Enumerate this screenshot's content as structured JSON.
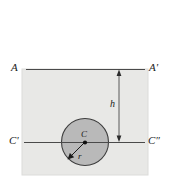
{
  "figure": {
    "background_color": "#ffffff",
    "plate": {
      "name": "rectangular-plate",
      "fill_color": "#e8e8e6",
      "stroke_color": "#d8d8d6",
      "x": 22,
      "y": 69,
      "width": 126,
      "height": 106
    },
    "circle": {
      "name": "circular-hole",
      "fill_color": "#b8b8b8",
      "stroke_color": "#404040",
      "cx": 85,
      "cy": 142,
      "r": 24
    },
    "center_dot": {
      "cx": 85,
      "cy": 142,
      "r": 2,
      "color": "#111111"
    },
    "lines": [
      {
        "name": "line-AA",
        "label_left": "A",
        "label_right": "A'",
        "y": 69,
        "x_start": 26,
        "x_end": 145,
        "color": "#4a4a4a"
      },
      {
        "name": "line-CC",
        "label_left": "C'",
        "label_right": "C″",
        "y": 142,
        "x_start": 24,
        "x_end": 145,
        "color": "#4a4a4a"
      }
    ],
    "dimension": {
      "name": "height-dimension",
      "label": "h",
      "x": 119,
      "y_top": 69,
      "y_bottom": 142,
      "color": "#4a4a4a",
      "arrow_both_ends": true
    },
    "radius": {
      "name": "radius-arrow",
      "label": "r",
      "from_x": 85,
      "from_y": 142,
      "to_x": 68,
      "to_y": 159,
      "color": "#1a1a1a"
    },
    "center_label": "C"
  }
}
